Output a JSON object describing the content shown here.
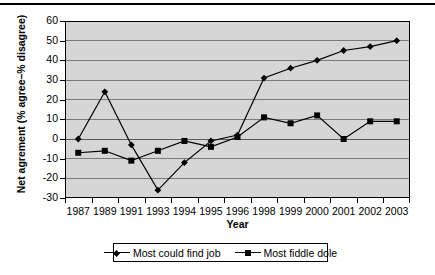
{
  "chart_data": {
    "type": "line",
    "title": "",
    "xlabel": "Year",
    "ylabel": "Net agrement (% agree–% disagree)",
    "categories": [
      "1987",
      "1989",
      "1991",
      "1993",
      "1994",
      "1995",
      "1996",
      "1998",
      "1999",
      "2000",
      "2001",
      "2002",
      "2003"
    ],
    "ylim": [
      -30,
      60
    ],
    "ytick_values": [
      60,
      50,
      40,
      30,
      20,
      10,
      0,
      -10,
      -20,
      -30
    ],
    "ytick_labels": [
      "60",
      "50",
      "40",
      "30",
      "20",
      "10",
      "0",
      "-10",
      "-20",
      "-30"
    ],
    "grid": true,
    "legend_position": "bottom",
    "series": [
      {
        "name": "Most could find job",
        "marker": "diamond",
        "color": "#000000",
        "values": [
          0,
          24,
          -3,
          -26,
          -12,
          -1,
          2,
          31,
          36,
          40,
          45,
          47,
          50
        ]
      },
      {
        "name": "Most fiddle dole",
        "marker": "square",
        "color": "#000000",
        "values": [
          -7,
          -6,
          -11,
          -6,
          -1,
          -4,
          1,
          11,
          8,
          12,
          0,
          9,
          9
        ]
      }
    ]
  },
  "legend": {
    "items": [
      {
        "label": "Most could find job",
        "marker": "diamond"
      },
      {
        "label": "Most fiddle dole",
        "marker": "square"
      }
    ]
  }
}
